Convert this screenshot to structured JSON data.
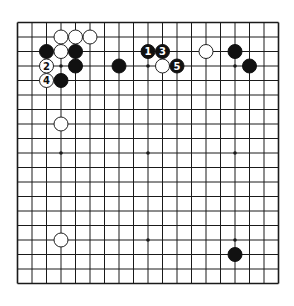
{
  "diagram": {
    "type": "go-board",
    "size": 19,
    "layout": {
      "origin_x": 17.5,
      "origin_y": 22.5,
      "spacing": 14.5,
      "stone_radius": 7
    },
    "colors": {
      "background": "#ffffff",
      "line": "#1a1a1a",
      "black_stone": "#111111",
      "white_stone": "#ffffff",
      "white_stone_border": "#222222",
      "black_label": "#ffffff",
      "white_label": "#111111"
    },
    "star_points": [
      {
        "col": 4,
        "row": 4
      },
      {
        "col": 10,
        "row": 4
      },
      {
        "col": 16,
        "row": 4
      },
      {
        "col": 4,
        "row": 10
      },
      {
        "col": 10,
        "row": 10
      },
      {
        "col": 16,
        "row": 10
      },
      {
        "col": 4,
        "row": 16
      },
      {
        "col": 10,
        "row": 16
      },
      {
        "col": 16,
        "row": 16
      }
    ],
    "stones": [
      {
        "color": "white",
        "col": 4,
        "row": 2,
        "label": ""
      },
      {
        "color": "white",
        "col": 5,
        "row": 2,
        "label": ""
      },
      {
        "color": "white",
        "col": 6,
        "row": 2,
        "label": ""
      },
      {
        "color": "black",
        "col": 3,
        "row": 3,
        "label": ""
      },
      {
        "color": "white",
        "col": 4,
        "row": 3,
        "label": ""
      },
      {
        "color": "black",
        "col": 5,
        "row": 3,
        "label": ""
      },
      {
        "color": "white",
        "col": 3,
        "row": 4,
        "label": "2"
      },
      {
        "color": "black",
        "col": 5,
        "row": 4,
        "label": ""
      },
      {
        "color": "white",
        "col": 3,
        "row": 5,
        "label": "4"
      },
      {
        "color": "black",
        "col": 4,
        "row": 5,
        "label": ""
      },
      {
        "color": "black",
        "col": 8,
        "row": 4,
        "label": ""
      },
      {
        "color": "white",
        "col": 4,
        "row": 8,
        "label": ""
      },
      {
        "color": "black",
        "col": 10,
        "row": 3,
        "label": "1"
      },
      {
        "color": "black",
        "col": 11,
        "row": 3,
        "label": "3"
      },
      {
        "color": "white",
        "col": 11,
        "row": 4,
        "label": ""
      },
      {
        "color": "black",
        "col": 12,
        "row": 4,
        "label": "5"
      },
      {
        "color": "white",
        "col": 14,
        "row": 3,
        "label": ""
      },
      {
        "color": "black",
        "col": 16,
        "row": 3,
        "label": ""
      },
      {
        "color": "black",
        "col": 17,
        "row": 4,
        "label": ""
      },
      {
        "color": "white",
        "col": 4,
        "row": 16,
        "label": ""
      },
      {
        "color": "black",
        "col": 16,
        "row": 17,
        "label": ""
      }
    ]
  }
}
